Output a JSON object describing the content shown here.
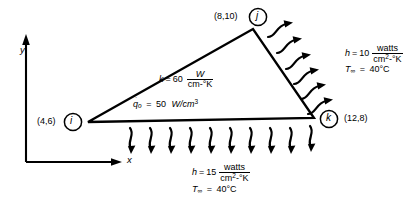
{
  "figure": {
    "type": "fem-triangular-element-heat-transfer",
    "background": "#ffffff",
    "ink": "#000000"
  },
  "axes": {
    "x_label": "x",
    "y_label": "y"
  },
  "element": {
    "nodes": [
      {
        "id": "i",
        "letter": "i",
        "coord_label": "(4,6)",
        "x": 4,
        "y": 6
      },
      {
        "id": "j",
        "letter": "j",
        "coord_label": "(8,10)",
        "x": 8,
        "y": 10
      },
      {
        "id": "k",
        "letter": "k",
        "coord_label": "(12,8)",
        "x": 12,
        "y": 8
      }
    ]
  },
  "material": {
    "conductivity": {
      "symbol": "k",
      "equals": "=",
      "value": "60",
      "numerator": "W",
      "denominator": "cm-°K"
    },
    "heat_generation": {
      "symbol": "q",
      "symbol_subscript": "o",
      "equals": "=",
      "value": "50",
      "units": "W/cm",
      "units_exponent": "3"
    }
  },
  "convection_right": {
    "h_symbol": "h",
    "h_equals": "=",
    "h_value": "10",
    "h_numerator": "watts",
    "h_denominator": "cm",
    "h_denominator_exp": "2",
    "h_denominator_tail": "-°K",
    "t_symbol": "T",
    "t_subscript": "∞",
    "t_equals": "=",
    "t_value": "40°C",
    "arrow_count": 6
  },
  "convection_bottom": {
    "h_symbol": "h",
    "h_equals": "=",
    "h_value": "15",
    "h_numerator": "watts",
    "h_denominator": "cm",
    "h_denominator_exp": "2",
    "h_denominator_tail": "-°K",
    "t_symbol": "T",
    "t_subscript": "∞",
    "t_equals": "=",
    "t_value": "40°C",
    "arrow_count": 10
  }
}
